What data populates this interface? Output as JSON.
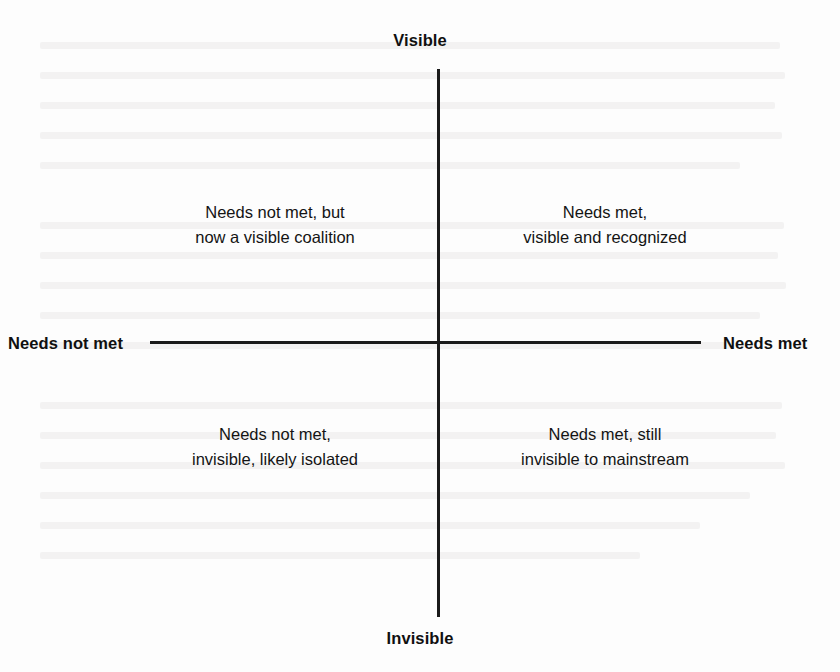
{
  "diagram": {
    "type": "two-by-two quadrant matrix",
    "background_color": "#fdfdfd",
    "line_color": "#1a1a1a",
    "text_color": "#141414"
  },
  "axes": {
    "vertical": {
      "top_label": "Visible",
      "bottom_label": "Invisible"
    },
    "horizontal": {
      "left_label": "Needs not met",
      "right_label": "Needs met"
    }
  },
  "quadrants": [
    {
      "position": "top-left",
      "lines": [
        "Needs not met, but",
        "now a visible coalition"
      ]
    },
    {
      "position": "top-right",
      "lines": [
        "Needs met,",
        "visible and recognized"
      ]
    },
    {
      "position": "bottom-left",
      "lines": [
        "Needs not met,",
        "invisible, likely isolated"
      ]
    },
    {
      "position": "bottom-right",
      "lines": [
        "Needs met, still",
        "invisible to mainstream"
      ]
    }
  ]
}
